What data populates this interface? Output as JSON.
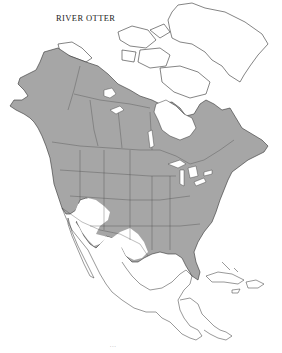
{
  "map": {
    "title": "RIVER OTTER",
    "subject": "River otter geographic range",
    "region": "North America",
    "legend": {
      "range_color": "#a6a6a6",
      "outline_color": "#333333",
      "background_color": "#ffffff",
      "range_label": "Range (shaded)"
    },
    "regions_shaded": [
      "Alaska",
      "Canada",
      "United States (most)"
    ],
    "regions_unshaded": [
      "Greenland",
      "Canadian Arctic Archipelago",
      "Southwestern United States",
      "Mexico",
      "Central America",
      "Caribbean"
    ],
    "footer_text": "..."
  }
}
